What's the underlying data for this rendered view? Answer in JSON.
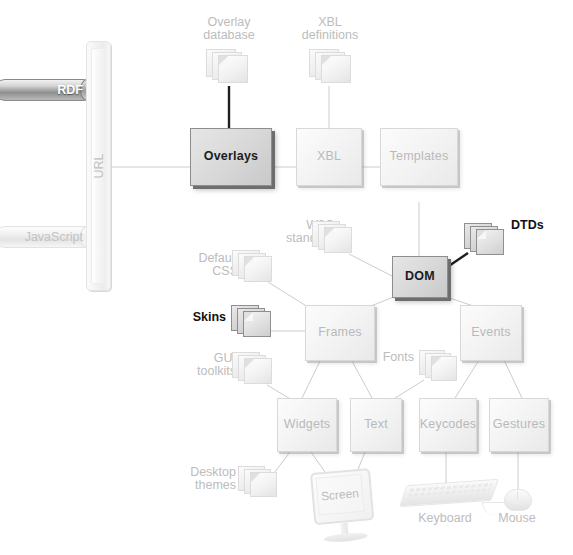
{
  "diagram": {
    "colors": {
      "highlight_fill": "#d6d6d6",
      "highlight_border": "#6e6e6e",
      "normal_fill": "#f4f4f4",
      "normal_text": "#bcbcbc",
      "highlight_text": "#111111",
      "line": "#c9c9c9",
      "line_highlight": "#1c1c1c"
    },
    "inputs": [
      {
        "id": "rdf",
        "label": "RDF",
        "kind": "cylinder",
        "highlighted": true
      },
      {
        "id": "javascript",
        "label": "JavaScript",
        "kind": "cylinder",
        "highlighted": false
      }
    ],
    "bus": {
      "id": "url",
      "label": "URL",
      "kind": "vertical-bar",
      "highlighted": false
    },
    "boxes": [
      {
        "id": "overlays",
        "label": "Overlays",
        "highlighted": true
      },
      {
        "id": "xbl",
        "label": "XBL",
        "highlighted": false
      },
      {
        "id": "templates",
        "label": "Templates",
        "highlighted": false
      },
      {
        "id": "dom",
        "label": "DOM",
        "highlighted": true
      },
      {
        "id": "frames",
        "label": "Frames",
        "highlighted": false
      },
      {
        "id": "events",
        "label": "Events",
        "highlighted": false
      },
      {
        "id": "widgets",
        "label": "Widgets",
        "highlighted": false
      },
      {
        "id": "text",
        "label": "Text",
        "highlighted": false
      },
      {
        "id": "keycodes",
        "label": "Keycodes",
        "highlighted": false
      },
      {
        "id": "gestures",
        "label": "Gestures",
        "highlighted": false
      }
    ],
    "resources": [
      {
        "id": "overlay-database",
        "label": "Overlay\ndatabase",
        "kind": "document-stack",
        "highlighted": false,
        "label_position": "above"
      },
      {
        "id": "xbl-definitions",
        "label": "XBL\ndefinitions",
        "kind": "document-stack",
        "highlighted": false,
        "label_position": "above"
      },
      {
        "id": "w3c-standards",
        "label": "W3C\nstandards",
        "kind": "document-stack",
        "highlighted": false,
        "label_position": "left"
      },
      {
        "id": "dtds",
        "label": "DTDs",
        "kind": "document-stack",
        "highlighted": true,
        "label_position": "right"
      },
      {
        "id": "default-css",
        "label": "Default\nCSS",
        "kind": "document-stack",
        "highlighted": false,
        "label_position": "left"
      },
      {
        "id": "skins",
        "label": "Skins",
        "kind": "document-stack",
        "highlighted": true,
        "label_position": "left"
      },
      {
        "id": "gui-toolkits",
        "label": "GUI\ntoolkits",
        "kind": "document-stack",
        "highlighted": false,
        "label_position": "left"
      },
      {
        "id": "desktop-themes",
        "label": "Desktop\nthemes",
        "kind": "document-stack",
        "highlighted": false,
        "label_position": "left"
      },
      {
        "id": "fonts",
        "label": "Fonts",
        "kind": "document-stack",
        "highlighted": false,
        "label_position": "left"
      }
    ],
    "devices": [
      {
        "id": "screen",
        "label": "Screen",
        "kind": "monitor",
        "label_position": "inside"
      },
      {
        "id": "keyboard",
        "label": "Keyboard",
        "kind": "keyboard",
        "label_position": "below"
      },
      {
        "id": "mouse",
        "label": "Mouse",
        "kind": "mouse",
        "label_position": "below"
      }
    ],
    "connections": [
      {
        "from": "url",
        "to": "overlays",
        "emphasis": "normal"
      },
      {
        "from": "overlay-database",
        "to": "overlays",
        "emphasis": "strong"
      },
      {
        "from": "overlays",
        "to": "xbl",
        "emphasis": "normal"
      },
      {
        "from": "xbl-definitions",
        "to": "xbl",
        "emphasis": "normal"
      },
      {
        "from": "xbl",
        "to": "templates",
        "emphasis": "normal"
      },
      {
        "from": "templates",
        "to": "dom",
        "emphasis": "normal"
      },
      {
        "from": "w3c-standards",
        "to": "dom",
        "emphasis": "normal"
      },
      {
        "from": "dtds",
        "to": "dom",
        "emphasis": "strong"
      },
      {
        "from": "dom",
        "to": "frames",
        "emphasis": "normal"
      },
      {
        "from": "dom",
        "to": "events",
        "emphasis": "normal"
      },
      {
        "from": "default-css",
        "to": "frames",
        "emphasis": "normal"
      },
      {
        "from": "skins",
        "to": "frames",
        "emphasis": "normal"
      },
      {
        "from": "gui-toolkits",
        "to": "widgets",
        "emphasis": "normal"
      },
      {
        "from": "desktop-themes",
        "to": "widgets",
        "emphasis": "normal"
      },
      {
        "from": "frames",
        "to": "widgets",
        "emphasis": "normal"
      },
      {
        "from": "frames",
        "to": "text",
        "emphasis": "normal"
      },
      {
        "from": "fonts",
        "to": "text",
        "emphasis": "normal"
      },
      {
        "from": "events",
        "to": "keycodes",
        "emphasis": "normal"
      },
      {
        "from": "events",
        "to": "gestures",
        "emphasis": "normal"
      },
      {
        "from": "widgets",
        "to": "screen",
        "emphasis": "normal"
      },
      {
        "from": "text",
        "to": "screen",
        "emphasis": "normal"
      },
      {
        "from": "keycodes",
        "to": "keyboard",
        "emphasis": "normal"
      },
      {
        "from": "gestures",
        "to": "mouse",
        "emphasis": "normal"
      }
    ]
  }
}
